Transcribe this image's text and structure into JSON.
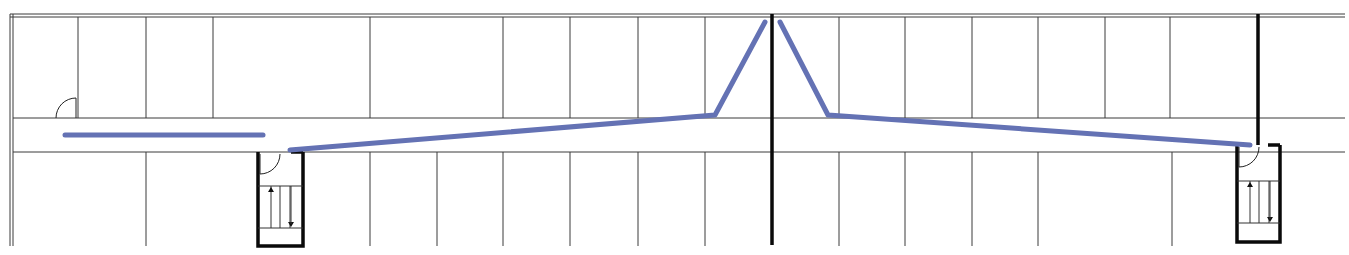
{
  "diagram": {
    "type": "floor-plan",
    "canvas": {
      "width": 1349,
      "height": 255
    },
    "colors": {
      "wall": "#3a3a3a",
      "thick_wall": "#0a0a0a",
      "route": "#6472b4",
      "background": "#ffffff"
    },
    "outer_walls": {
      "top_y": [
        14,
        17
      ],
      "left_x": [
        10,
        13
      ],
      "x_end": 1345,
      "bottom_y": 246
    },
    "corridor": {
      "top_y": 118,
      "bottom_y": 152,
      "x_start": 13,
      "x_end": 1345
    },
    "upper_room_dividers_x": [
      78,
      146,
      213,
      370,
      503,
      570,
      638,
      705,
      839,
      905,
      972,
      1038,
      1105,
      1170
    ],
    "lower_room_dividers_x": [
      146,
      370,
      437,
      503,
      570,
      638,
      705,
      839,
      905,
      972,
      1038,
      1172
    ],
    "thick_walls": [
      {
        "name": "central-fire-wall",
        "x1": 772,
        "y1": 14,
        "x2": 772,
        "y2": 245
      },
      {
        "name": "east-fire-wall",
        "x1": 1258,
        "y1": 14,
        "x2": 1258,
        "y2": 145
      }
    ],
    "doors": [
      {
        "name": "upper-left-room-door",
        "hinge": [
          76,
          118
        ],
        "radius": 20,
        "orientation": "up-left"
      }
    ],
    "stairwells": [
      {
        "name": "west-stairwell",
        "x": 258,
        "y": 152,
        "w": 45,
        "h": 94,
        "door_radius": 20,
        "treads_y": [
          186,
          228
        ],
        "tread_dividers_x": [
          271,
          280,
          290
        ],
        "arrow_up_x": 271,
        "arrow_down_x": 291
      },
      {
        "name": "east-stairwell",
        "x": 1237,
        "y": 145,
        "w": 43,
        "h": 97,
        "door_radius": 20,
        "treads_y": [
          181,
          223
        ],
        "tread_dividers_x": [
          1250,
          1259,
          1269
        ],
        "arrow_up_x": 1250,
        "arrow_down_x": 1270
      }
    ],
    "routes": [
      {
        "name": "route-west-corridor",
        "points": [
          [
            65,
            135
          ],
          [
            263,
            135
          ]
        ]
      },
      {
        "name": "route-west-to-center",
        "points": [
          [
            290,
            150
          ],
          [
            715,
            115
          ],
          [
            765,
            22
          ]
        ]
      },
      {
        "name": "route-center-to-east",
        "points": [
          [
            780,
            22
          ],
          [
            828,
            115
          ],
          [
            1250,
            145
          ]
        ]
      }
    ]
  }
}
